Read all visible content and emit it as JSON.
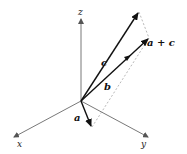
{
  "diagram": {
    "type": "3d-vector-addition",
    "axes": {
      "x": {
        "label": "x"
      },
      "y": {
        "label": "y"
      },
      "z": {
        "label": "z"
      }
    },
    "vectors": {
      "a": {
        "label": "a"
      },
      "b": {
        "label": "b"
      },
      "c": {
        "label": "c"
      },
      "sum": {
        "label": "a + c"
      }
    },
    "colors": {
      "axis": "#555555",
      "vector": "#222222",
      "dashed": "#999999"
    }
  }
}
